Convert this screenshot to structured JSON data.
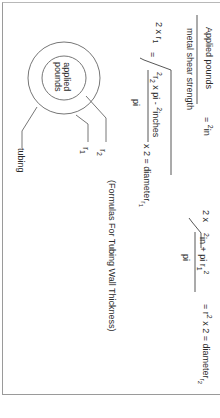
{
  "page": {
    "caption": "(Formulas For Tubing Wall Thickness)",
    "formula1": {
      "numerator": "Applied pounds",
      "denominator": "metal shear strength",
      "result_eq": "=",
      "result_sup": "2",
      "result_unit": "in"
    },
    "formula2": {
      "lhs": "2 x r",
      "lhs_sub": "1",
      "eq": "=",
      "radicand_sup_a": "2",
      "radicand_a": "r",
      "radicand_sub_a": "2",
      "radicand_mid": "x pi -",
      "radicand_sup_b": "2",
      "radicand_b": "inches",
      "denominator": "pi",
      "rhs": "x 2 = diameter",
      "rhs_sub_r": "r",
      "rhs_sub": "1"
    },
    "formula3": {
      "lhs": "2 x",
      "radicand_sup_a": "2",
      "radicand_a": "in + pi r",
      "radicand_sub": "1",
      "radicand_sup_b": "2",
      "denominator": "pi",
      "rhs_a": "= r",
      "rhs_sup": "2",
      "rhs_b": "x 2 = diameter",
      "rhs_sub_r": "r",
      "rhs_sub": "2"
    },
    "diagram": {
      "inner_label_line1": "applied",
      "inner_label_line2": "pounds",
      "labels": {
        "tubing": "tubing",
        "r1": "r",
        "r1_sub": "1",
        "r2": "r",
        "r2_sub": "2"
      }
    }
  }
}
